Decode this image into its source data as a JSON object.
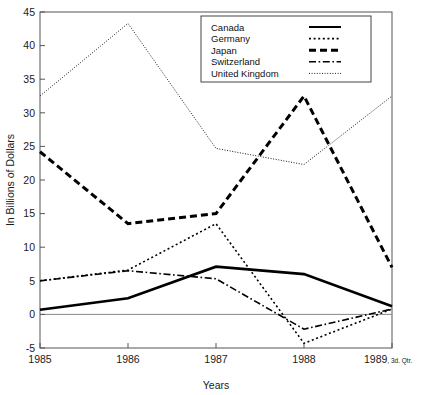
{
  "chart_data": {
    "type": "line",
    "title": "",
    "xlabel": "Years",
    "ylabel": "In Billions of Dollars",
    "categories": [
      "1985",
      "1986",
      "1987",
      "1988",
      "1989"
    ],
    "x_tick_labels": [
      "1985",
      "1986",
      "1987",
      "1988",
      "1989"
    ],
    "x_last_tick_suffix": ", 3d. Qtr.",
    "y_tick_labels": [
      "-5",
      "0",
      "5",
      "10",
      "15",
      "20",
      "25",
      "30",
      "35",
      "40",
      "45"
    ],
    "ylim": [
      -5,
      45
    ],
    "y_step": 5,
    "grid": false,
    "legend_position": "top-right",
    "series": [
      {
        "name": "Canada",
        "style": "solid",
        "stroke_width": 2.6,
        "dash": "",
        "values": [
          0.7,
          2.4,
          7.1,
          6.0,
          1.2
        ]
      },
      {
        "name": "Germany",
        "style": "dotted",
        "stroke_width": 1.6,
        "dash": "2,2.6",
        "values": [
          5.0,
          6.6,
          13.5,
          -4.3,
          0.8
        ]
      },
      {
        "name": "Japan",
        "style": "dashed",
        "stroke_width": 3.0,
        "dash": "7,4",
        "values": [
          24.2,
          13.5,
          15.0,
          32.5,
          7.0
        ]
      },
      {
        "name": "Switzerland",
        "style": "dash-dot",
        "stroke_width": 1.6,
        "dash": "7,2.6,1.6,2.6",
        "values": [
          5.0,
          6.5,
          5.3,
          -2.2,
          0.8
        ]
      },
      {
        "name": "United Kingdom",
        "style": "fine-dotted",
        "stroke_width": 0.9,
        "dash": "1,1.6",
        "values": [
          32.5,
          43.3,
          24.7,
          22.3,
          32.5
        ]
      }
    ]
  },
  "legend": {
    "entries": [
      {
        "label": "Canada",
        "dash": "",
        "stroke_width": 2.0
      },
      {
        "label": "Germany",
        "dash": "2,2.6",
        "stroke_width": 1.6
      },
      {
        "label": "Japan",
        "dash": "7,4",
        "stroke_width": 3.0
      },
      {
        "label": "Switzerland",
        "dash": "7,2.6,1.6,2.6",
        "stroke_width": 1.6
      },
      {
        "label": "United Kingdom",
        "dash": "1,1.6",
        "stroke_width": 0.9
      }
    ]
  },
  "colors": {
    "line": "#000000",
    "axis": "#555555",
    "zero_line": "#888888",
    "background": "#ffffff",
    "text": "#111111"
  }
}
